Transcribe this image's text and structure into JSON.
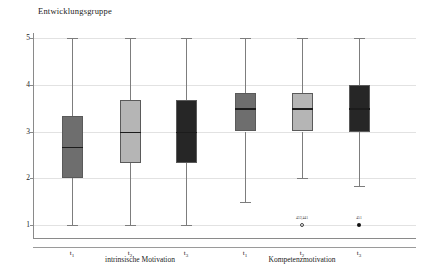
{
  "chart_data": {
    "type": "box",
    "title": "Entwicklungsgruppe",
    "xlabel": "",
    "ylabel": "",
    "ylim": [
      1,
      5
    ],
    "yticks": [
      5,
      4,
      3,
      2,
      1
    ],
    "grid": true,
    "legend": "none",
    "groups": [
      {
        "name": "intrinsische Motivation",
        "categories": [
          "t1",
          "t2",
          "t3"
        ]
      },
      {
        "name": "Kompetenzmotivation",
        "categories": [
          "t1",
          "t2",
          "t3"
        ]
      }
    ],
    "boxes": [
      {
        "label": "t1",
        "group": "intrinsische Motivation",
        "whisker_low": 1.0,
        "q1": 2.0,
        "median": 2.67,
        "q3": 3.33,
        "whisker_high": 5.0,
        "color": "#6e6e6e",
        "outliers": []
      },
      {
        "label": "t2",
        "group": "intrinsische Motivation",
        "whisker_low": 1.0,
        "q1": 2.33,
        "median": 3.0,
        "q3": 3.67,
        "whisker_high": 5.0,
        "color": "#b5b5b5",
        "outliers": []
      },
      {
        "label": "t3",
        "group": "intrinsische Motivation",
        "whisker_low": 1.0,
        "q1": 2.33,
        "median": 3.0,
        "q3": 3.67,
        "whisker_high": 5.0,
        "color": "#262626",
        "outliers": []
      },
      {
        "label": "t1",
        "group": "Kompetenzmotivation",
        "whisker_low": 1.5,
        "q1": 3.0,
        "median": 3.5,
        "q3": 3.83,
        "whisker_high": 5.0,
        "color": "#6e6e6e",
        "outliers": []
      },
      {
        "label": "t2",
        "group": "Kompetenzmotivation",
        "whisker_low": 2.0,
        "q1": 3.0,
        "median": 3.5,
        "q3": 3.83,
        "whisker_high": 5.0,
        "color": "#b5b5b5",
        "outliers": [
          {
            "value": 1.0,
            "marker": "hollow",
            "label": "433¦441"
          }
        ]
      },
      {
        "label": "t3",
        "group": "Kompetenzmotivation",
        "whisker_low": 1.83,
        "q1": 3.0,
        "median": 3.5,
        "q3": 4.0,
        "whisker_high": 5.0,
        "color": "#262626",
        "outliers": [
          {
            "value": 1.0,
            "marker": "solid",
            "label": "451"
          }
        ]
      }
    ]
  },
  "axis": {
    "y_tick_labels": [
      "5",
      "4",
      "3",
      "2",
      "1"
    ],
    "x_tick_labels": [
      "t1",
      "t2",
      "t3",
      "t1",
      "t2",
      "t3"
    ],
    "x_tick_sub": [
      "1",
      "2",
      "3",
      "1",
      "2",
      "3"
    ],
    "x_tick_base": [
      "t",
      "t",
      "t",
      "t",
      "t",
      "t"
    ]
  },
  "labels": {
    "title": "Entwicklungsgruppe",
    "group_left": "intrinsische Motivation",
    "group_right": "Kompetenzmotivation",
    "outlier_left": "433¦441",
    "outlier_right": "451"
  },
  "colors": {
    "box_medium_gray": "#6e6e6e",
    "box_light_gray": "#b5b5b5",
    "box_dark": "#262626",
    "grid": "#e2e2e2",
    "axis": "#8a8a8a",
    "background": "#ffffff"
  }
}
